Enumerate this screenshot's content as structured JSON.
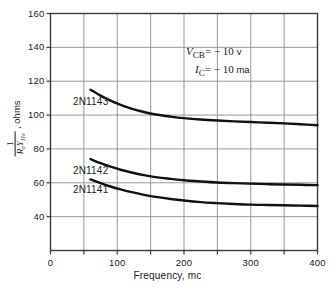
{
  "chart_data": {
    "type": "line",
    "title": "",
    "xlabel": "Frequency, mc",
    "ylabel": "1/(R_e Y_11e), ohms",
    "ylabel_parts": {
      "numerator": "1",
      "denominator": "R",
      "denominator_sub1": "e",
      "denominator_sym2": "Y",
      "denominator_sub2": "11e",
      "units": ", ohms"
    },
    "xlim": [
      0,
      400
    ],
    "ylim": [
      20,
      160
    ],
    "xticks": [
      0,
      100,
      200,
      300,
      400
    ],
    "yticks": [
      40,
      60,
      80,
      100,
      120,
      140,
      160
    ],
    "x_gridlines": [
      50,
      100,
      150,
      200,
      250,
      300,
      350
    ],
    "y_gridlines": [
      40,
      60,
      80,
      100,
      120,
      140
    ],
    "grid": true,
    "legend": "inline-labels",
    "annotations": [
      {
        "symbol": "V",
        "subscript": "CB",
        "value": "= − 10",
        "unit": "v"
      },
      {
        "symbol": "I",
        "subscript": "C",
        "value": "= − 10",
        "unit": "ma"
      }
    ],
    "series": [
      {
        "name": "2N1143",
        "label_x": 95,
        "label_y": 108,
        "x": [
          60,
          75,
          90,
          105,
          120,
          140,
          160,
          180,
          200,
          225,
          250,
          275,
          300,
          325,
          350,
          375,
          400
        ],
        "y": [
          115.0,
          111.5,
          108.5,
          106.0,
          104.0,
          101.8,
          100.2,
          99.1,
          98.2,
          97.4,
          96.8,
          96.3,
          95.9,
          95.5,
          95.1,
          94.6,
          94.0
        ]
      },
      {
        "name": "2N1142",
        "label_x": 95,
        "label_y": 67,
        "x": [
          60,
          75,
          90,
          105,
          120,
          140,
          160,
          180,
          200,
          225,
          250,
          275,
          300,
          325,
          350,
          375,
          400
        ],
        "y": [
          74.0,
          71.6,
          69.5,
          67.7,
          66.2,
          64.5,
          63.2,
          62.3,
          61.5,
          60.8,
          60.2,
          59.8,
          59.5,
          59.2,
          59.0,
          58.8,
          58.6
        ]
      },
      {
        "name": "2N1141",
        "label_x": 95,
        "label_y": 56,
        "x": [
          60,
          75,
          90,
          105,
          120,
          140,
          160,
          180,
          200,
          225,
          250,
          275,
          300,
          325,
          350,
          375,
          400
        ],
        "y": [
          62.0,
          59.8,
          57.8,
          56.1,
          54.6,
          52.9,
          51.5,
          50.4,
          49.5,
          48.6,
          48.0,
          47.5,
          47.1,
          46.9,
          46.7,
          46.5,
          46.3
        ]
      }
    ]
  },
  "axis": {
    "y_tick_labels": [
      "160",
      "140",
      "120",
      "100",
      "80",
      "60",
      "40"
    ],
    "x_tick_labels": [
      "0",
      "100",
      "200",
      "300",
      "400"
    ],
    "x_title": "Frequency, mc",
    "y_title_units": ", ohms"
  },
  "annotation_text": {
    "line1_symbol": "V",
    "line1_sub": "CB",
    "line1_value": "= − 10",
    "line1_unit": "v",
    "line2_symbol": "I",
    "line2_sub": "C",
    "line2_value": "= − 10",
    "line2_unit": "ma"
  },
  "curve_labels": {
    "top": "2N1143",
    "middle": "2N1142",
    "bottom": "2N1141"
  },
  "colors": {
    "curve": "#111111",
    "axis": "#3b3b3b",
    "grid": "#8c8c8c",
    "text": "#1a1a1a",
    "background": "#ffffff"
  }
}
